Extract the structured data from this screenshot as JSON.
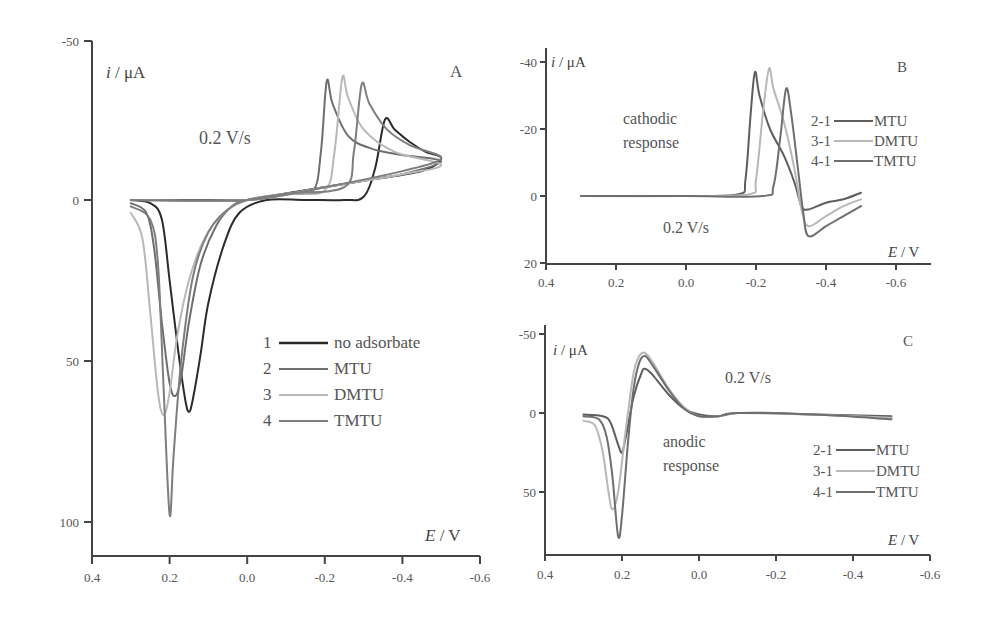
{
  "chart_data": [
    {
      "panel": "A",
      "type": "line",
      "title": "",
      "panel_label": "A",
      "xlabel": "E / V",
      "ylabel": "i / μA",
      "xlim": [
        0.4,
        -0.6
      ],
      "ylim": [
        -50,
        110
      ],
      "y_inverted": true,
      "xticks": [
        "0.4",
        "0.2",
        "0.0",
        "-0.2",
        "-0.4",
        "-0.6"
      ],
      "yticks": [
        "-50",
        "0",
        "50",
        "100"
      ],
      "annotation": "0.2 V/s",
      "legend": [
        {
          "num": "1",
          "label": "no adsorbate",
          "color": "#2b2b2b"
        },
        {
          "num": "2",
          "label": "MTU",
          "color": "#6e6e6e"
        },
        {
          "num": "3",
          "label": "DMTU",
          "color": "#b8b8b8"
        },
        {
          "num": "4",
          "label": "TMTU",
          "color": "#7e7e7e"
        }
      ],
      "series": [
        {
          "name": "no adsorbate",
          "color": "#2b2b2b",
          "points": [
            [
              0.3,
              0
            ],
            [
              0.25,
              1
            ],
            [
              0.22,
              6
            ],
            [
              0.2,
              25
            ],
            [
              0.18,
              45
            ],
            [
              0.16,
              62
            ],
            [
              0.15,
              66
            ],
            [
              0.14,
              62
            ],
            [
              0.12,
              48
            ],
            [
              0.1,
              32
            ],
            [
              0.06,
              14
            ],
            [
              0.02,
              4
            ],
            [
              -0.05,
              0
            ],
            [
              -0.15,
              0
            ],
            [
              -0.25,
              0
            ],
            [
              -0.3,
              -1
            ],
            [
              -0.33,
              -10
            ],
            [
              -0.355,
              -25
            ],
            [
              -0.38,
              -22
            ],
            [
              -0.42,
              -18
            ],
            [
              -0.46,
              -15
            ],
            [
              -0.5,
              -13
            ],
            [
              -0.45,
              -9
            ],
            [
              -0.3,
              -6
            ],
            [
              -0.1,
              -2
            ],
            [
              0.0,
              0
            ],
            [
              0.1,
              0
            ],
            [
              0.2,
              0
            ],
            [
              0.3,
              0
            ]
          ]
        },
        {
          "name": "MTU",
          "color": "#6e6e6e",
          "points": [
            [
              0.3,
              1
            ],
            [
              0.26,
              4
            ],
            [
              0.24,
              15
            ],
            [
              0.22,
              38
            ],
            [
              0.2,
              57
            ],
            [
              0.185,
              61
            ],
            [
              0.17,
              55
            ],
            [
              0.15,
              38
            ],
            [
              0.12,
              20
            ],
            [
              0.08,
              8
            ],
            [
              0.04,
              2
            ],
            [
              0.0,
              0
            ],
            [
              -0.1,
              -2
            ],
            [
              -0.17,
              -3
            ],
            [
              -0.19,
              -15
            ],
            [
              -0.205,
              -37
            ],
            [
              -0.22,
              -30
            ],
            [
              -0.26,
              -20
            ],
            [
              -0.32,
              -16
            ],
            [
              -0.4,
              -14
            ],
            [
              -0.5,
              -12
            ],
            [
              -0.4,
              -8
            ],
            [
              -0.3,
              -6
            ],
            [
              -0.1,
              -2
            ],
            [
              0.0,
              0
            ],
            [
              0.3,
              0
            ]
          ]
        },
        {
          "name": "DMTU",
          "color": "#b8b8b8",
          "points": [
            [
              0.3,
              4
            ],
            [
              0.27,
              12
            ],
            [
              0.25,
              35
            ],
            [
              0.23,
              60
            ],
            [
              0.215,
              67
            ],
            [
              0.2,
              60
            ],
            [
              0.18,
              42
            ],
            [
              0.15,
              25
            ],
            [
              0.11,
              12
            ],
            [
              0.06,
              4
            ],
            [
              0.0,
              0
            ],
            [
              -0.1,
              -2
            ],
            [
              -0.2,
              -3
            ],
            [
              -0.225,
              -15
            ],
            [
              -0.245,
              -38
            ],
            [
              -0.26,
              -32
            ],
            [
              -0.3,
              -22
            ],
            [
              -0.38,
              -15
            ],
            [
              -0.5,
              -11
            ],
            [
              -0.4,
              -8
            ],
            [
              -0.2,
              -4
            ],
            [
              0.0,
              0
            ],
            [
              0.3,
              0
            ]
          ]
        },
        {
          "name": "TMTU",
          "color": "#7e7e7e",
          "points": [
            [
              0.3,
              2
            ],
            [
              0.25,
              6
            ],
            [
              0.23,
              20
            ],
            [
              0.215,
              60
            ],
            [
              0.2,
              98
            ],
            [
              0.19,
              80
            ],
            [
              0.17,
              50
            ],
            [
              0.14,
              24
            ],
            [
              0.1,
              10
            ],
            [
              0.05,
              3
            ],
            [
              0.0,
              0
            ],
            [
              -0.1,
              -2
            ],
            [
              -0.25,
              -4
            ],
            [
              -0.275,
              -15
            ],
            [
              -0.295,
              -36
            ],
            [
              -0.315,
              -30
            ],
            [
              -0.36,
              -22
            ],
            [
              -0.42,
              -17
            ],
            [
              -0.5,
              -13
            ],
            [
              -0.4,
              -9
            ],
            [
              -0.2,
              -4
            ],
            [
              0.0,
              0
            ],
            [
              0.3,
              0
            ]
          ]
        }
      ]
    },
    {
      "panel": "B",
      "type": "line",
      "panel_label": "B",
      "xlabel": "E / V",
      "ylabel": "i / μA",
      "xlim": [
        0.4,
        -0.7
      ],
      "ylim": [
        -40,
        20
      ],
      "y_inverted": true,
      "xticks": [
        "0.4",
        "0.2",
        "0.0",
        "-0.2",
        "-0.4",
        "-0.6"
      ],
      "yticks": [
        "-40",
        "-20",
        "0",
        "20"
      ],
      "annotation_1": "cathodic",
      "annotation_2": "response",
      "annotation_rate": "0.2 V/s",
      "legend": [
        {
          "num": "2-1",
          "label": "MTU",
          "color": "#5e5e5e"
        },
        {
          "num": "3-1",
          "label": "DMTU",
          "color": "#b8b8b8"
        },
        {
          "num": "4-1",
          "label": "TMTU",
          "color": "#6e6e6e"
        }
      ],
      "series": [
        {
          "name": "2-1 MTU",
          "color": "#5e5e5e",
          "points": [
            [
              0.3,
              0
            ],
            [
              0.0,
              0
            ],
            [
              -0.15,
              -0.5
            ],
            [
              -0.17,
              -5
            ],
            [
              -0.185,
              -25
            ],
            [
              -0.197,
              -37
            ],
            [
              -0.21,
              -30
            ],
            [
              -0.24,
              -20
            ],
            [
              -0.28,
              -12
            ],
            [
              -0.31,
              -4
            ],
            [
              -0.33,
              3
            ],
            [
              -0.35,
              4
            ],
            [
              -0.4,
              2
            ],
            [
              -0.45,
              1
            ],
            [
              -0.5,
              -1
            ]
          ]
        },
        {
          "name": "3-1 DMTU",
          "color": "#b8b8b8",
          "points": [
            [
              0.3,
              0
            ],
            [
              0.0,
              0
            ],
            [
              -0.18,
              -0.5
            ],
            [
              -0.2,
              -5
            ],
            [
              -0.22,
              -25
            ],
            [
              -0.237,
              -38
            ],
            [
              -0.25,
              -32
            ],
            [
              -0.28,
              -22
            ],
            [
              -0.31,
              -8
            ],
            [
              -0.33,
              4
            ],
            [
              -0.35,
              9
            ],
            [
              -0.4,
              6
            ],
            [
              -0.45,
              3
            ],
            [
              -0.5,
              1
            ]
          ]
        },
        {
          "name": "4-1 TMTU",
          "color": "#6e6e6e",
          "points": [
            [
              0.3,
              0
            ],
            [
              0.0,
              0
            ],
            [
              -0.22,
              0
            ],
            [
              -0.25,
              -3
            ],
            [
              -0.27,
              -18
            ],
            [
              -0.286,
              -32
            ],
            [
              -0.3,
              -25
            ],
            [
              -0.32,
              -8
            ],
            [
              -0.335,
              5
            ],
            [
              -0.35,
              12
            ],
            [
              -0.4,
              9
            ],
            [
              -0.45,
              6
            ],
            [
              -0.5,
              3
            ]
          ]
        }
      ]
    },
    {
      "panel": "C",
      "type": "line",
      "panel_label": "C",
      "xlabel": "E / V",
      "ylabel": "i / μA",
      "xlim": [
        0.4,
        -0.6
      ],
      "ylim": [
        -50,
        90
      ],
      "y_inverted": true,
      "xticks": [
        "0.4",
        "0.2",
        "0.0",
        "-0.2",
        "-0.4",
        "-0.6"
      ],
      "yticks": [
        "-50",
        "0",
        "50"
      ],
      "annotation_1": "anodic",
      "annotation_2": "response",
      "annotation_rate": "0.2 V/s",
      "legend": [
        {
          "num": "2-1",
          "label": "MTU",
          "color": "#5e5e5e"
        },
        {
          "num": "3-1",
          "label": "DMTU",
          "color": "#b8b8b8"
        },
        {
          "num": "4-1",
          "label": "TMTU",
          "color": "#6e6e6e"
        }
      ],
      "series": [
        {
          "name": "2-1 MTU",
          "color": "#5e5e5e",
          "points": [
            [
              0.3,
              1
            ],
            [
              0.25,
              2
            ],
            [
              0.23,
              6
            ],
            [
              0.21,
              20
            ],
            [
              0.2,
              25
            ],
            [
              0.19,
              15
            ],
            [
              0.17,
              -10
            ],
            [
              0.15,
              -25
            ],
            [
              0.14,
              -28
            ],
            [
              0.12,
              -24
            ],
            [
              0.08,
              -12
            ],
            [
              0.04,
              -3
            ],
            [
              0.0,
              1
            ],
            [
              -0.05,
              2
            ],
            [
              -0.1,
              0
            ],
            [
              -0.2,
              0
            ],
            [
              -0.3,
              1
            ],
            [
              -0.5,
              2
            ]
          ]
        },
        {
          "name": "3-1 DMTU",
          "color": "#b8b8b8",
          "points": [
            [
              0.3,
              5
            ],
            [
              0.27,
              8
            ],
            [
              0.25,
              25
            ],
            [
              0.235,
              50
            ],
            [
              0.225,
              61
            ],
            [
              0.21,
              50
            ],
            [
              0.19,
              10
            ],
            [
              0.17,
              -25
            ],
            [
              0.155,
              -36
            ],
            [
              0.14,
              -38
            ],
            [
              0.12,
              -32
            ],
            [
              0.08,
              -16
            ],
            [
              0.04,
              -4
            ],
            [
              0.0,
              2
            ],
            [
              -0.05,
              2
            ],
            [
              -0.1,
              0
            ],
            [
              -0.3,
              1
            ],
            [
              -0.5,
              3
            ]
          ]
        },
        {
          "name": "4-1 TMTU",
          "color": "#6e6e6e",
          "points": [
            [
              0.3,
              2
            ],
            [
              0.26,
              4
            ],
            [
              0.24,
              15
            ],
            [
              0.225,
              40
            ],
            [
              0.21,
              78
            ],
            [
              0.2,
              65
            ],
            [
              0.185,
              20
            ],
            [
              0.17,
              -15
            ],
            [
              0.155,
              -32
            ],
            [
              0.14,
              -36
            ],
            [
              0.12,
              -30
            ],
            [
              0.08,
              -15
            ],
            [
              0.04,
              -3
            ],
            [
              0.0,
              2
            ],
            [
              -0.05,
              2
            ],
            [
              -0.1,
              0
            ],
            [
              -0.3,
              1
            ],
            [
              -0.5,
              4
            ]
          ]
        }
      ]
    }
  ]
}
